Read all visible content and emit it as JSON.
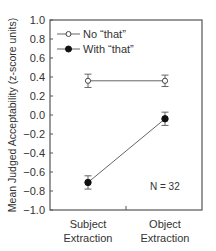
{
  "chart_data": {
    "type": "line",
    "title": "",
    "xlabel": "",
    "ylabel": "Mean Judged Acceptability (z-score units)",
    "categories": [
      "Subject Extraction",
      "Object Extraction"
    ],
    "category_lines": [
      [
        "Subject",
        "Extraction"
      ],
      [
        "Object",
        "Extraction"
      ]
    ],
    "ylim": [
      -1.0,
      1.0
    ],
    "yticks": [
      1.0,
      0.8,
      0.6,
      0.4,
      0.2,
      0.0,
      -0.2,
      -0.4,
      -0.6,
      -0.8,
      -1.0
    ],
    "ytick_labels": [
      "1.0",
      "0.8",
      "0.6",
      "0.4",
      "0.2",
      "0.0",
      "−0.2",
      "−0.4",
      "−0.6",
      "−0.8",
      "−1.0"
    ],
    "grid": false,
    "legend_position": "upper left",
    "series": [
      {
        "name": "No “that”",
        "marker": "open-circle",
        "values": [
          0.36,
          0.36
        ],
        "errors": [
          0.07,
          0.06
        ]
      },
      {
        "name": "With “that”",
        "marker": "filled-circle",
        "values": [
          -0.71,
          -0.04
        ],
        "errors": [
          0.07,
          0.07
        ]
      }
    ],
    "annotations": [
      "N = 32"
    ]
  },
  "colors": {
    "axis": "#555555",
    "line": "#666666",
    "marker": "#111111",
    "text": "#333333"
  }
}
